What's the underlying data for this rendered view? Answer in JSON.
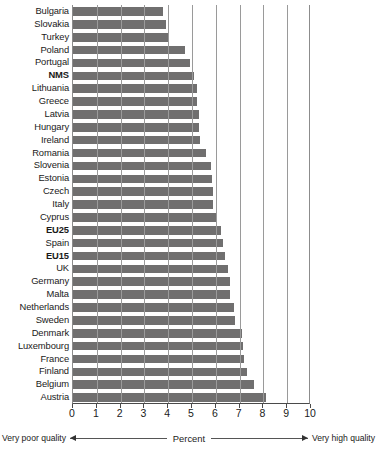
{
  "chart_data": {
    "type": "bar",
    "orientation": "horizontal",
    "title": "",
    "xlabel": "Percent",
    "ylabel": "",
    "xlim": [
      0,
      10
    ],
    "xticks": [
      0,
      1,
      2,
      3,
      4,
      5,
      6,
      7,
      8,
      9,
      10
    ],
    "grid": true,
    "legend": "none",
    "bar_color": "#706f6f",
    "axis_left_annotation": "Very poor quality",
    "axis_right_annotation": "Very high quality",
    "categories": [
      "Bulgaria",
      "Slovakia",
      "Turkey",
      "Poland",
      "Portugal",
      "NMS",
      "Lithuania",
      "Greece",
      "Latvia",
      "Hungary",
      "Ireland",
      "Romania",
      "Slovenia",
      "Estonia",
      "Czech",
      "Italy",
      "Cyprus",
      "EU25",
      "Spain",
      "EU15",
      "UK",
      "Germany",
      "Malta",
      "Netherlands",
      "Sweden",
      "Denmark",
      "Luxembourg",
      "France",
      "Finland",
      "Belgium",
      "Austria"
    ],
    "emphasized_categories": [
      "NMS",
      "EU25",
      "EU15"
    ],
    "values": [
      3.8,
      3.9,
      4.0,
      4.7,
      4.9,
      5.1,
      5.2,
      5.2,
      5.3,
      5.3,
      5.35,
      5.6,
      5.8,
      5.85,
      5.9,
      5.9,
      6.0,
      6.2,
      6.3,
      6.4,
      6.5,
      6.6,
      6.6,
      6.75,
      6.8,
      7.1,
      7.15,
      7.2,
      7.3,
      7.6,
      8.1
    ]
  }
}
